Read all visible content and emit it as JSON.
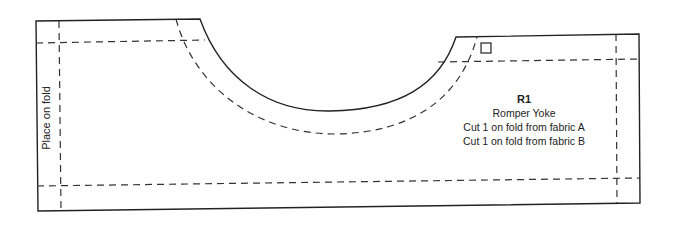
{
  "pattern_piece": {
    "id": "R1",
    "name": "Romper Yoke",
    "cut_instructions": [
      "Cut 1 on fold from fabric A",
      "Cut 1 on fold from fabric B"
    ],
    "fold_label": "Place on fold",
    "notch_marker": "square-marker"
  },
  "colors": {
    "line": "#222222",
    "dash": "#333333",
    "background": "#ffffff"
  }
}
